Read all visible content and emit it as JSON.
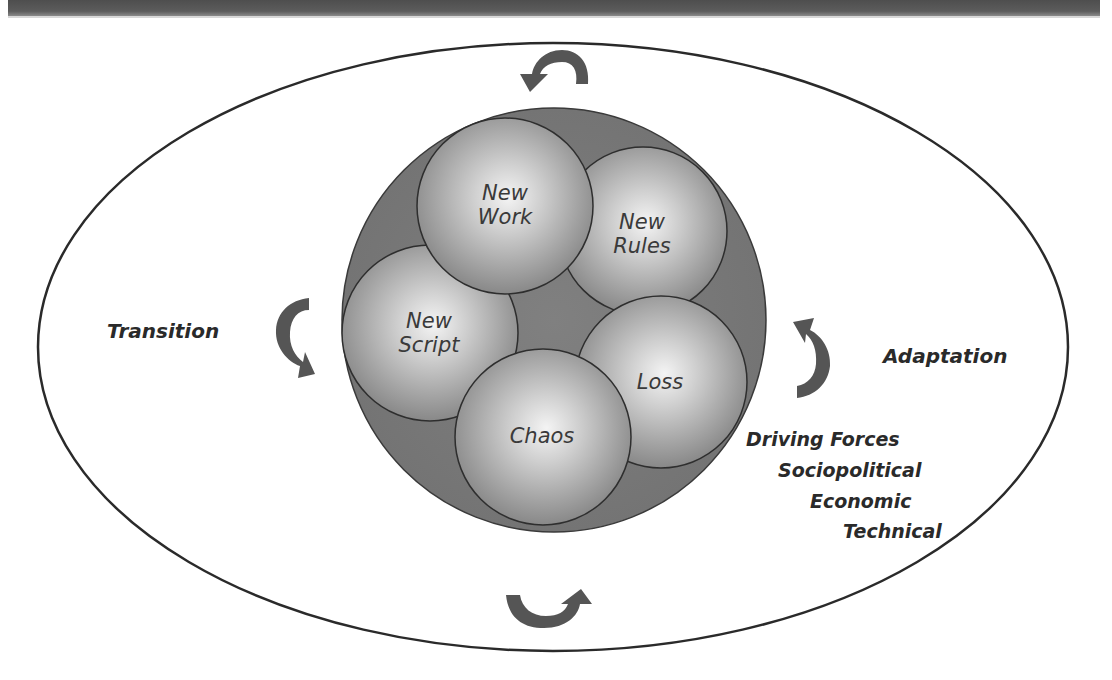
{
  "header": {
    "title": ""
  },
  "colors": {
    "header_bar": "#555555",
    "outer_ellipse_stroke": "#2a2a2a",
    "container_circle_fill": "#7a7a7a",
    "sphere_highlight": "#f2f2f2",
    "sphere_shadow": "#8c8c8c",
    "arrow_fill": "#555555",
    "text": "#2e2e2e"
  },
  "diagram": {
    "left_label": "Transition",
    "right_label": "Adaptation",
    "spheres": [
      {
        "id": "new-work",
        "line1": "New",
        "line2": "Work"
      },
      {
        "id": "new-rules",
        "line1": "New",
        "line2": "Rules"
      },
      {
        "id": "new-script",
        "line1": "New",
        "line2": "Script"
      },
      {
        "id": "loss",
        "line1": "Loss",
        "line2": ""
      },
      {
        "id": "chaos",
        "line1": "Chaos",
        "line2": ""
      }
    ],
    "driving_forces": {
      "title": "Driving Forces",
      "items": [
        "Sociopolitical",
        "Economic",
        "Technical"
      ]
    },
    "arrows": [
      {
        "position": "top",
        "icon": "curved-arrow-counterclockwise-icon"
      },
      {
        "position": "bottom",
        "icon": "curved-arrow-up-icon"
      },
      {
        "position": "left",
        "icon": "curved-arrow-down-icon"
      },
      {
        "position": "right",
        "icon": "curved-arrow-up-icon"
      }
    ]
  }
}
